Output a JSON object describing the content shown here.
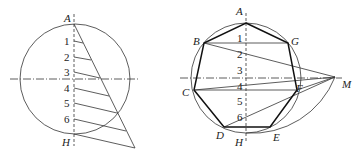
{
  "left_figure": {
    "title": "Division of diameter into 7 equal parts",
    "point_labels": {
      "top": "A",
      "bottom": "H"
    },
    "division_labels": [
      "1",
      "2",
      "3",
      "4",
      "5",
      "6"
    ]
  },
  "right_figure": {
    "title": "Inscribed regular heptagon construction",
    "vertex_labels": {
      "A": "A",
      "B": "B",
      "C": "C",
      "D": "D",
      "E": "E",
      "F": "F",
      "G": "G",
      "H": "H",
      "M": "M"
    },
    "division_labels": [
      "1",
      "2",
      "3",
      "4",
      "5",
      "6"
    ]
  },
  "colors": {
    "line": "#333333",
    "thick": "#111111",
    "background": "#ffffff"
  }
}
